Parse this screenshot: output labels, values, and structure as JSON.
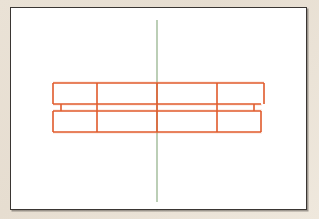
{
  "document": {
    "title": "Technical Line Drawing",
    "description": "Orthographic elevation sketch of a two-tier horizontal rail assembly with a vertical centerline",
    "medium": "line drawing on white paper mounted on beige mat"
  },
  "mat": {
    "background_color": "#e8dfd3",
    "name": "beige-mount-board"
  },
  "canvas": {
    "background_color": "#ffffff",
    "border_color": "#3a3633",
    "border_width_px": 1,
    "x": 10,
    "y": 7,
    "width": 297,
    "height": 203
  },
  "colors": {
    "rail_stroke": "#e05a2b",
    "rail_stroke_light": "#e8764a",
    "centerline_stroke": "#9fb898",
    "frame_stroke": "#3a3633",
    "paper": "#ffffff"
  },
  "centerline": {
    "label": "vertical centerline",
    "color": "#9fb898",
    "x": 146,
    "y_top": 12,
    "y_bottom": 194,
    "stroke_width": 1.4
  },
  "drawing": {
    "name": "two-tier-rail-assembly",
    "stroke_width": 1.6,
    "upper_band": {
      "label": "upper rail band",
      "x_left": 42,
      "x_right": 253,
      "y_top": 75,
      "y_bottom": 96
    },
    "lower_band": {
      "label": "lower rail band",
      "x_left": 42,
      "x_right": 250,
      "y_top": 103,
      "y_bottom": 124
    },
    "midrail_top": {
      "label": "upper face of middle rail",
      "x_left": 42,
      "x_right": 250,
      "y": 96
    },
    "midrail_bottom": {
      "label": "lower face of middle rail",
      "x_left": 42,
      "x_right": 250,
      "y": 103
    },
    "vertical_dividers": [
      {
        "label": "divider-1",
        "x": 86,
        "y_top": 75,
        "y_bottom": 124
      },
      {
        "label": "divider-2",
        "x": 146,
        "y_top": 75,
        "y_bottom": 124
      },
      {
        "label": "divider-3",
        "x": 206,
        "y_top": 75,
        "y_bottom": 124
      }
    ],
    "left_connector": {
      "label": "left web stub",
      "x": 50,
      "y_top": 96,
      "y_bottom": 103
    },
    "right_connector": {
      "label": "right web stub",
      "x": 243,
      "y_top": 96,
      "y_bottom": 103
    },
    "bay_count": 4,
    "tier_count": 2
  }
}
